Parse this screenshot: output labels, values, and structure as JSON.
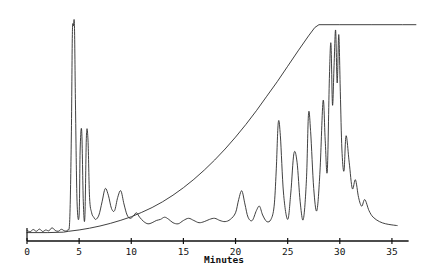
{
  "figure": {
    "background_color": "#ffffff",
    "trace_color": "#2b2b2b",
    "axis_color": "#111111"
  },
  "axis": {
    "x_title": "Minutes",
    "tick_labels": [
      "0",
      "5",
      "10",
      "15",
      "20",
      "25",
      "30",
      "35"
    ],
    "tick_values": [
      0,
      5,
      10,
      15,
      20,
      25,
      30,
      35
    ],
    "x_min": 0,
    "x_max": 37.5,
    "origin_tick": true,
    "y_axis_visible": false
  },
  "chart_data": {
    "type": "line",
    "title": "",
    "xlabel": "Minutes",
    "ylabel": "",
    "xlim": [
      0,
      37.5
    ],
    "ylim": [
      0,
      100
    ],
    "grid": false,
    "legend": "none",
    "series": [
      {
        "name": "detector-signal",
        "note": "HPLC chromatogram detector trace; main peak near 4.5 min is clipped/saturated",
        "x": [
          0.0,
          0.3,
          0.6,
          0.9,
          1.2,
          1.5,
          1.8,
          2.1,
          2.4,
          2.7,
          3.0,
          3.3,
          3.6,
          3.9,
          4.1,
          4.25,
          4.35,
          4.45,
          4.55,
          4.65,
          4.8,
          5.0,
          5.1,
          5.25,
          5.4,
          5.55,
          5.7,
          5.85,
          6.0,
          6.2,
          6.4,
          6.6,
          6.9,
          7.2,
          7.5,
          7.8,
          8.1,
          8.4,
          8.7,
          9.0,
          9.3,
          9.6,
          9.9,
          10.2,
          10.5,
          10.8,
          11.2,
          11.6,
          12.0,
          12.4,
          12.8,
          13.2,
          13.6,
          14.0,
          14.5,
          15.0,
          15.5,
          16.0,
          16.5,
          17.0,
          17.5,
          18.0,
          18.5,
          19.0,
          19.5,
          20.0,
          20.3,
          20.6,
          20.9,
          21.2,
          21.6,
          22.0,
          22.3,
          22.6,
          23.0,
          23.4,
          23.7,
          23.9,
          24.1,
          24.3,
          24.6,
          25.0,
          25.3,
          25.6,
          25.9,
          26.2,
          26.5,
          26.8,
          27.0,
          27.2,
          27.5,
          27.8,
          28.1,
          28.4,
          28.6,
          28.8,
          29.0,
          29.15,
          29.3,
          29.45,
          29.6,
          29.75,
          29.9,
          30.05,
          30.2,
          30.4,
          30.6,
          30.9,
          31.2,
          31.5,
          31.8,
          32.1,
          32.4,
          32.8,
          33.2,
          33.8,
          34.4,
          35.0,
          35.5
        ],
        "y": [
          3.0,
          2.4,
          3.4,
          2.6,
          3.6,
          2.5,
          3.2,
          2.8,
          4.2,
          3.0,
          2.6,
          3.5,
          2.8,
          3.2,
          8.0,
          45.0,
          92.0,
          96.0,
          96.0,
          60.0,
          16.0,
          10.0,
          40.0,
          48.0,
          16.0,
          9.0,
          46.0,
          44.0,
          18.0,
          11.0,
          9.0,
          8.0,
          10.0,
          16.0,
          22.0,
          19.0,
          13.0,
          12.0,
          18.0,
          21.0,
          15.0,
          10.0,
          8.5,
          9.5,
          11.0,
          9.0,
          7.0,
          6.0,
          6.5,
          7.5,
          8.0,
          9.0,
          8.0,
          6.5,
          6.0,
          7.5,
          8.5,
          7.5,
          6.5,
          7.0,
          8.0,
          8.5,
          7.5,
          7.0,
          8.0,
          11.0,
          17.0,
          21.0,
          15.0,
          9.0,
          7.5,
          12.0,
          14.0,
          10.0,
          7.0,
          8.0,
          14.0,
          30.0,
          52.0,
          46.0,
          20.0,
          8.0,
          20.0,
          38.0,
          34.0,
          16.0,
          8.0,
          26.0,
          56.0,
          48.0,
          22.0,
          12.0,
          30.0,
          62.0,
          44.0,
          30.0,
          72.0,
          88.0,
          60.0,
          78.0,
          94.0,
          70.0,
          92.0,
          66.0,
          40.0,
          30.0,
          46.0,
          34.0,
          22.0,
          26.0,
          18.0,
          14.0,
          17.0,
          12.0,
          9.0,
          7.0,
          6.0,
          5.5,
          5.2
        ]
      },
      {
        "name": "gradient-program",
        "note": "solvent gradient trace; rises from baseline near 4 min, plateaus at about 28 min",
        "x": [
          0.0,
          2.0,
          3.5,
          4.0,
          5.0,
          6.0,
          7.0,
          8.0,
          9.0,
          10.0,
          11.0,
          12.0,
          13.0,
          14.0,
          15.0,
          16.0,
          17.0,
          18.0,
          19.0,
          20.0,
          21.0,
          22.0,
          23.0,
          24.0,
          25.0,
          26.0,
          27.0,
          27.6,
          28.0,
          30.0,
          33.0,
          36.0,
          37.3
        ],
        "y": [
          2.0,
          2.0,
          2.2,
          2.6,
          3.2,
          4.0,
          5.0,
          6.2,
          7.6,
          9.2,
          11.2,
          13.4,
          16.0,
          19.0,
          22.4,
          26.2,
          30.4,
          35.0,
          40.0,
          45.4,
          51.2,
          57.4,
          64.0,
          70.6,
          77.6,
          84.6,
          91.4,
          95.2,
          96.5,
          96.5,
          96.5,
          96.5,
          96.5
        ]
      }
    ]
  }
}
